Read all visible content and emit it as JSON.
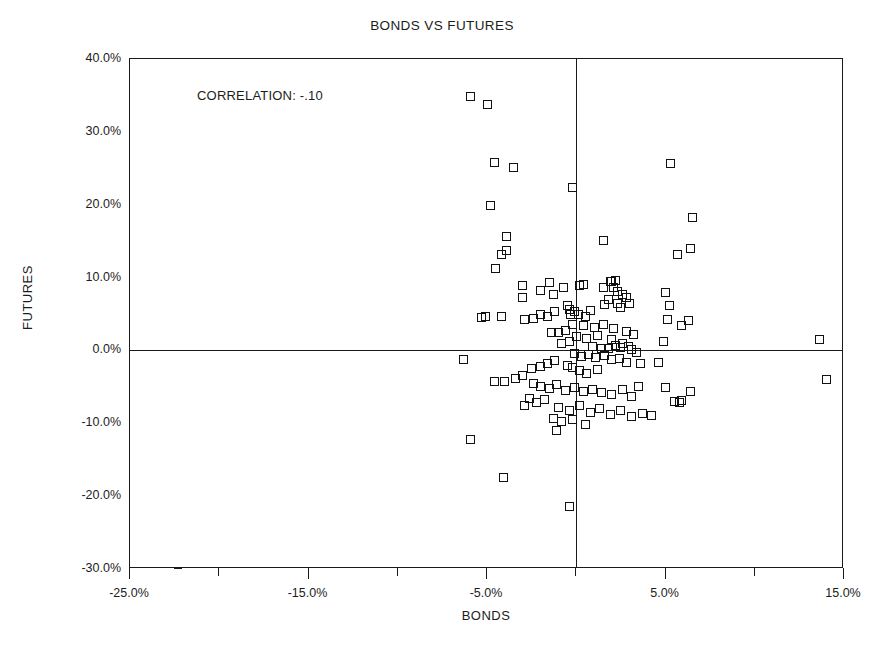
{
  "chart_data": {
    "type": "scatter",
    "title": "BONDS VS FUTURES",
    "xlabel": "BONDS",
    "ylabel": "FUTURES",
    "xlim": [
      -25,
      15
    ],
    "ylim": [
      -30,
      40
    ],
    "grid": false,
    "legend": null,
    "annotations": [
      {
        "text": "CORRELATION: -.10",
        "x": -20.5,
        "y": 34.5
      }
    ],
    "xticks": [
      -25,
      -15,
      -5,
      5,
      15
    ],
    "xtick_labels": [
      "-25.0%",
      "-15.0%",
      "-5.0%",
      "5.0%",
      "15.0%"
    ],
    "xticks_minor": [
      -20,
      -10,
      0,
      10
    ],
    "yticks": [
      40,
      30,
      20,
      10,
      0,
      -10,
      -20,
      -30
    ],
    "ytick_labels": [
      "40.0%",
      "30.0%",
      "20.0%",
      "10.0%",
      "0.0%",
      "-10.0%",
      "-20.0%",
      "-30.0%"
    ],
    "marker": {
      "shape": "square",
      "filled": false,
      "edge_color": "#111111",
      "size_px": 9
    },
    "zero_lines": {
      "x": 0,
      "y": 0,
      "color": "#1a1a1a"
    },
    "series": [
      {
        "name": "observations",
        "points": [
          [
            -5.9,
            34.9
          ],
          [
            -5.0,
            33.8
          ],
          [
            -4.6,
            25.8
          ],
          [
            -3.5,
            25.1
          ],
          [
            -0.2,
            22.4
          ],
          [
            5.3,
            25.6
          ],
          [
            -4.8,
            19.9
          ],
          [
            6.5,
            18.3
          ],
          [
            -3.9,
            15.7
          ],
          [
            -3.9,
            13.7
          ],
          [
            -4.2,
            13.2
          ],
          [
            1.5,
            15.1
          ],
          [
            5.7,
            13.2
          ],
          [
            6.4,
            14.0
          ],
          [
            -4.5,
            11.2
          ],
          [
            5.0,
            7.9
          ],
          [
            -3.0,
            8.9
          ],
          [
            -3.0,
            7.2
          ],
          [
            -2.0,
            8.2
          ],
          [
            -1.5,
            9.3
          ],
          [
            -1.3,
            7.7
          ],
          [
            -0.7,
            8.7
          ],
          [
            -0.5,
            6.1
          ],
          [
            -0.4,
            5.6
          ],
          [
            0.2,
            8.9
          ],
          [
            0.4,
            9.0
          ],
          [
            1.5,
            8.6
          ],
          [
            1.9,
            9.5
          ],
          [
            2.0,
            9.4
          ],
          [
            2.1,
            8.7
          ],
          [
            2.2,
            9.6
          ],
          [
            2.3,
            8.1
          ],
          [
            2.6,
            7.7
          ],
          [
            2.8,
            7.2
          ],
          [
            1.8,
            7.0
          ],
          [
            1.6,
            6.3
          ],
          [
            2.3,
            6.4
          ],
          [
            2.5,
            5.9
          ],
          [
            3.0,
            6.5
          ],
          [
            -0.3,
            4.9
          ],
          [
            -0.1,
            5.3
          ],
          [
            0.1,
            5.0
          ],
          [
            0.5,
            4.6
          ],
          [
            0.8,
            5.5
          ],
          [
            -1.2,
            5.3
          ],
          [
            -1.6,
            4.6
          ],
          [
            -2.0,
            5.0
          ],
          [
            -2.4,
            4.4
          ],
          [
            -2.9,
            4.2
          ],
          [
            -5.1,
            4.7
          ],
          [
            -5.3,
            4.5
          ],
          [
            -4.2,
            4.6
          ],
          [
            5.2,
            6.2
          ],
          [
            -0.2,
            3.6
          ],
          [
            0.4,
            3.4
          ],
          [
            1.0,
            3.2
          ],
          [
            1.5,
            3.6
          ],
          [
            2.1,
            3.0
          ],
          [
            2.8,
            2.6
          ],
          [
            3.2,
            2.2
          ],
          [
            -0.6,
            2.7
          ],
          [
            -1.0,
            2.5
          ],
          [
            -1.4,
            2.4
          ],
          [
            0.0,
            1.9
          ],
          [
            0.6,
            1.6
          ],
          [
            1.2,
            2.0
          ],
          [
            2.0,
            1.5
          ],
          [
            2.6,
            1.0
          ],
          [
            -0.4,
            1.2
          ],
          [
            -0.8,
            0.9
          ],
          [
            5.1,
            4.2
          ],
          [
            6.3,
            4.1
          ],
          [
            5.9,
            3.4
          ],
          [
            0.9,
            0.5
          ],
          [
            1.4,
            0.3
          ],
          [
            1.8,
            0.2
          ],
          [
            2.2,
            0.7
          ],
          [
            2.5,
            0.4
          ],
          [
            2.9,
            0.6
          ],
          [
            3.1,
            0.1
          ],
          [
            3.4,
            -0.3
          ],
          [
            4.9,
            1.2
          ],
          [
            13.6,
            1.5
          ],
          [
            -0.1,
            -0.4
          ],
          [
            0.3,
            -0.8
          ],
          [
            0.7,
            -0.6
          ],
          [
            1.1,
            -1.0
          ],
          [
            1.6,
            -0.7
          ],
          [
            2.0,
            -1.3
          ],
          [
            2.4,
            -1.1
          ],
          [
            2.8,
            -1.6
          ],
          [
            3.6,
            -1.8
          ],
          [
            4.6,
            -1.7
          ],
          [
            -6.3,
            -1.2
          ],
          [
            -1.2,
            -1.4
          ],
          [
            -1.6,
            -1.8
          ],
          [
            -2.0,
            -2.2
          ],
          [
            -2.5,
            -2.5
          ],
          [
            -0.5,
            -2.0
          ],
          [
            -0.2,
            -2.4
          ],
          [
            0.2,
            -2.8
          ],
          [
            0.6,
            -3.1
          ],
          [
            1.2,
            -2.6
          ],
          [
            -3.0,
            -3.4
          ],
          [
            -3.4,
            -3.9
          ],
          [
            -4.0,
            -4.3
          ],
          [
            -4.6,
            -4.2
          ],
          [
            -2.4,
            -4.5
          ],
          [
            -2.0,
            -4.9
          ],
          [
            -1.5,
            -5.2
          ],
          [
            -1.1,
            -4.7
          ],
          [
            -0.6,
            -5.5
          ],
          [
            -0.1,
            -5.1
          ],
          [
            0.4,
            -5.6
          ],
          [
            0.9,
            -5.3
          ],
          [
            1.4,
            -5.8
          ],
          [
            2.0,
            -6.0
          ],
          [
            2.6,
            -5.4
          ],
          [
            3.1,
            -6.3
          ],
          [
            3.5,
            -4.9
          ],
          [
            5.0,
            -5.1
          ],
          [
            6.4,
            -5.6
          ],
          [
            5.5,
            -7.0
          ],
          [
            5.8,
            -7.2
          ],
          [
            5.9,
            -6.9
          ],
          [
            14.0,
            -4.0
          ],
          [
            -2.6,
            -6.6
          ],
          [
            -2.2,
            -7.1
          ],
          [
            -1.8,
            -6.8
          ],
          [
            -2.9,
            -7.5
          ],
          [
            -1.0,
            -7.8
          ],
          [
            -0.4,
            -8.2
          ],
          [
            0.2,
            -7.6
          ],
          [
            0.8,
            -8.5
          ],
          [
            1.3,
            -8.0
          ],
          [
            1.9,
            -8.8
          ],
          [
            2.5,
            -8.3
          ],
          [
            3.1,
            -9.0
          ],
          [
            3.7,
            -8.6
          ],
          [
            4.2,
            -8.9
          ],
          [
            -1.3,
            -9.3
          ],
          [
            -0.8,
            -9.8
          ],
          [
            -0.2,
            -9.5
          ],
          [
            0.5,
            -10.1
          ],
          [
            -1.1,
            -11.0
          ],
          [
            -5.9,
            -12.2
          ],
          [
            -4.1,
            -17.5
          ],
          [
            -0.4,
            -21.4
          ]
        ]
      }
    ]
  }
}
